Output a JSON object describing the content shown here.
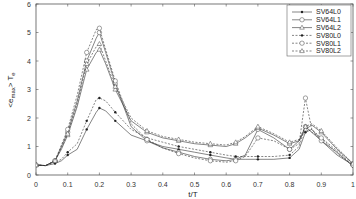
{
  "chart_data": {
    "type": "line",
    "title": "",
    "xlabel": "t/T",
    "ylabel": "<e_max> T_e",
    "xlim": [
      0,
      1
    ],
    "ylim": [
      0,
      6
    ],
    "xticks": [
      "0",
      "0.1",
      "0.2",
      "0.3",
      "0.4",
      "0.5",
      "0.6",
      "0.7",
      "0.8",
      "0.9",
      "1"
    ],
    "yticks": [
      "0",
      "1",
      "2",
      "3",
      "4",
      "5",
      "6"
    ],
    "grid": false,
    "legend_position": "upper right",
    "x": [
      0,
      0.03,
      0.06,
      0.08,
      0.1,
      0.13,
      0.16,
      0.19,
      0.2,
      0.22,
      0.25,
      0.3,
      0.35,
      0.4,
      0.45,
      0.5,
      0.55,
      0.6,
      0.63,
      0.66,
      0.7,
      0.75,
      0.8,
      0.83,
      0.85,
      0.87,
      0.9,
      0.95,
      1.0
    ],
    "series": [
      {
        "name": "SV64L0",
        "style": "solid",
        "marker": "dot",
        "values": [
          0.35,
          0.33,
          0.4,
          0.5,
          0.7,
          0.9,
          1.6,
          2.2,
          2.35,
          2.25,
          1.9,
          1.4,
          1.2,
          1.0,
          0.9,
          0.8,
          0.7,
          0.6,
          0.55,
          0.55,
          0.55,
          0.55,
          0.6,
          0.9,
          1.5,
          1.6,
          1.2,
          0.8,
          0.3
        ]
      },
      {
        "name": "SV64L1",
        "style": "solid",
        "marker": "circle",
        "values": [
          0.35,
          0.33,
          0.5,
          1.0,
          1.5,
          2.6,
          4.0,
          4.8,
          5.0,
          4.3,
          3.2,
          1.7,
          1.2,
          0.95,
          0.8,
          0.65,
          0.55,
          0.5,
          0.55,
          0.7,
          1.6,
          1.3,
          0.9,
          1.2,
          1.7,
          1.5,
          1.2,
          0.7,
          0.35
        ]
      },
      {
        "name": "SV64L2",
        "style": "solid",
        "marker": "triangle",
        "values": [
          0.35,
          0.33,
          0.5,
          0.9,
          1.4,
          2.4,
          3.7,
          4.3,
          4.4,
          3.9,
          3.0,
          1.9,
          1.5,
          1.3,
          1.2,
          1.1,
          1.05,
          1.0,
          1.1,
          1.3,
          1.65,
          1.4,
          1.1,
          1.2,
          1.6,
          1.75,
          1.5,
          0.9,
          0.4
        ]
      },
      {
        "name": "SV80L0",
        "style": "dashed",
        "marker": "dot",
        "values": [
          0.35,
          0.33,
          0.45,
          0.55,
          0.8,
          1.1,
          1.9,
          2.65,
          2.7,
          2.6,
          2.2,
          1.6,
          1.3,
          1.15,
          1.0,
          0.9,
          0.8,
          0.7,
          0.65,
          0.65,
          0.65,
          0.65,
          0.7,
          1.0,
          1.7,
          1.5,
          1.3,
          0.85,
          0.35
        ]
      },
      {
        "name": "SV80L1",
        "style": "dashed",
        "marker": "circle",
        "values": [
          0.35,
          0.33,
          0.5,
          1.05,
          1.6,
          2.8,
          4.3,
          5.1,
          5.15,
          4.4,
          3.3,
          1.8,
          1.25,
          0.95,
          0.75,
          0.6,
          0.5,
          0.45,
          0.5,
          0.65,
          1.3,
          1.2,
          0.9,
          1.1,
          2.7,
          1.6,
          1.3,
          0.75,
          0.35
        ]
      },
      {
        "name": "SV80L2",
        "style": "dashed",
        "marker": "triangle",
        "values": [
          0.35,
          0.33,
          0.5,
          0.95,
          1.45,
          2.5,
          3.9,
          4.5,
          4.6,
          4.0,
          3.1,
          2.0,
          1.55,
          1.35,
          1.25,
          1.15,
          1.1,
          1.05,
          1.15,
          1.35,
          1.7,
          1.45,
          1.15,
          1.25,
          1.7,
          1.8,
          1.55,
          0.95,
          0.4
        ]
      }
    ]
  }
}
